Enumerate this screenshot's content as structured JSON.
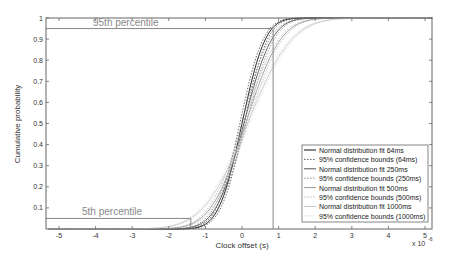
{
  "chart_data": {
    "type": "line",
    "title": "",
    "xlabel": "Clock offset (s)",
    "ylabel": "Cumulative probability",
    "x_exponent_label": "x 10",
    "x_exponent": "-6",
    "xlim": [
      -5.3,
      5.2
    ],
    "ylim": [
      0,
      1
    ],
    "xticks": [
      -5,
      -4,
      -3,
      -2,
      -1,
      0,
      1,
      2,
      3,
      4,
      5
    ],
    "xtick_labels": [
      "-5",
      "-4",
      "-3",
      "-2",
      "-1",
      "0",
      "1",
      "2",
      "3",
      "4",
      "5"
    ],
    "yticks": [
      0.1,
      0.2,
      0.3,
      0.4,
      0.5,
      0.6,
      0.7,
      0.8,
      0.9,
      1
    ],
    "ytick_labels": [
      "0.1",
      "0.2",
      "0.3",
      "0.4",
      "0.5",
      "0.6",
      "0.7",
      "0.8",
      "0.9",
      "1"
    ],
    "grid": false,
    "legend_position": "lower right",
    "annotations": [
      {
        "text": "95th percentile",
        "y": 0.95
      },
      {
        "text": "5th percentile",
        "y": 0.05
      }
    ],
    "reference_lines": {
      "horizontal": [
        0.95,
        0.05
      ],
      "vertical": [
        -1.4,
        0.85
      ]
    },
    "series": [
      {
        "name": "Normal distribution fit 64ms",
        "style": "solid",
        "color": "#111111",
        "mean": 0.0,
        "sigma": 0.5
      },
      {
        "name": "95% confidence bounds (64ms)",
        "style": "dotted",
        "color": "#333333",
        "mean": 0.0,
        "sigma": 0.5
      },
      {
        "name": "Normal distribution fit 250ms",
        "style": "solid",
        "color": "#555555",
        "mean": 0.05,
        "sigma": 0.6
      },
      {
        "name": "95% confidence bounds (250ms)",
        "style": "dotted",
        "color": "#777777",
        "mean": 0.05,
        "sigma": 0.6
      },
      {
        "name": "Normal distribution fit 500ms",
        "style": "solid",
        "color": "#999999",
        "mean": 0.1,
        "sigma": 0.75
      },
      {
        "name": "95%  confidence bounds (500ms)",
        "style": "dotted",
        "color": "#aaaaaa",
        "mean": 0.1,
        "sigma": 0.75
      },
      {
        "name": "Normal distribution fit 1000ms",
        "style": "solid",
        "color": "#c4c4c4",
        "mean": 0.15,
        "sigma": 0.95
      },
      {
        "name": "95% confidence bounds (1000ms)",
        "style": "dotted",
        "color": "#d4d4d4",
        "mean": 0.15,
        "sigma": 0.95
      }
    ]
  }
}
